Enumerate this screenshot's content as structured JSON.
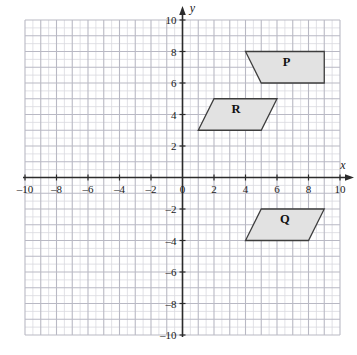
{
  "chart_data": {
    "type": "scatter",
    "title": "",
    "xlabel": "x",
    "ylabel": "y",
    "xlim": [
      -10,
      10
    ],
    "ylim": [
      -10,
      10
    ],
    "grid": true,
    "grid_minor_step": 0.5,
    "grid_major_step": 1,
    "x_ticks": [
      -10,
      -8,
      -6,
      -4,
      -2,
      0,
      2,
      4,
      6,
      8,
      10
    ],
    "y_ticks": [
      -10,
      -8,
      -6,
      -4,
      -2,
      2,
      4,
      6,
      8,
      10
    ],
    "x_tick_labels": [
      "–10",
      "–8",
      "–6",
      "–4",
      "–2",
      "0",
      "2",
      "4",
      "6",
      "8",
      "10"
    ],
    "y_tick_labels": [
      "–10",
      "–8",
      "–6",
      "–4",
      "–2",
      "2",
      "4",
      "6",
      "8",
      "10"
    ],
    "origin_label": "0",
    "legend": "none",
    "shapes": [
      {
        "name": "P",
        "label": "P",
        "kind": "parallelogram",
        "vertices": [
          [
            4,
            8
          ],
          [
            9,
            8
          ],
          [
            9,
            6
          ],
          [
            5,
            6
          ]
        ],
        "label_at": [
          6.6,
          7.1
        ],
        "fill": "#e2e2e2",
        "stroke": "#3d3d3d"
      },
      {
        "name": "R",
        "label": "R",
        "kind": "parallelogram",
        "vertices": [
          [
            2,
            5
          ],
          [
            6,
            5
          ],
          [
            5,
            3
          ],
          [
            1,
            3
          ]
        ],
        "label_at": [
          3.4,
          4.1
        ],
        "fill": "#e2e2e2",
        "stroke": "#3d3d3d"
      },
      {
        "name": "Q",
        "label": "Q",
        "kind": "parallelogram",
        "vertices": [
          [
            5,
            -2
          ],
          [
            9,
            -2
          ],
          [
            8,
            -4
          ],
          [
            4,
            -4
          ]
        ],
        "label_at": [
          6.5,
          -2.9
        ],
        "fill": "#e2e2e2",
        "stroke": "#3d3d3d"
      }
    ],
    "colors": {
      "grid_minor": "#d9d9e0",
      "grid_major": "#b9b9c4",
      "axis": "#2b2b2b",
      "shape_fill": "#e2e2e2",
      "shape_stroke": "#3d3d3d",
      "background": "#ffffff"
    }
  },
  "axes": {
    "x_axis_label": "x",
    "y_axis_label": "y"
  }
}
